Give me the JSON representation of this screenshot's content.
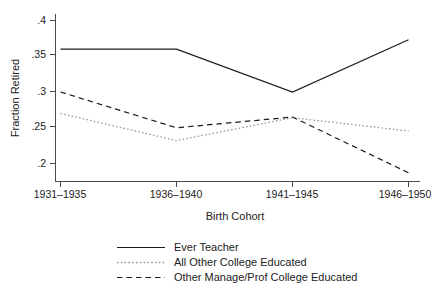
{
  "chart_data": {
    "type": "line",
    "title": "",
    "xlabel": "Birth Cohort",
    "ylabel": "Fraction Retired",
    "categories": [
      "1931–1935",
      "1936–1940",
      "1941–1945",
      "1946–1950"
    ],
    "ylim": [
      0.18,
      0.405
    ],
    "yticks": [
      0.2,
      0.25,
      0.3,
      0.35,
      0.4
    ],
    "ytick_labels": [
      ".2",
      ".25",
      ".3",
      ".35",
      ".4"
    ],
    "grid": false,
    "legend_position": "bottom",
    "series": [
      {
        "name": "Ever Teacher",
        "style": "solid",
        "color": "#1c1c1c",
        "values": [
          0.36,
          0.36,
          0.3,
          0.373
        ]
      },
      {
        "name": "All Other College Educated",
        "style": "dotted",
        "color": "#9a9a9a",
        "values": [
          0.27,
          0.232,
          0.264,
          0.2455
        ]
      },
      {
        "name": "Other Manage/Prof College Educated",
        "style": "dashed",
        "color": "#1c1c1c",
        "values": [
          0.3,
          0.25,
          0.265,
          0.187
        ]
      }
    ]
  },
  "axes": {
    "y_title": "Fraction Retired",
    "x_title": "Birth Cohort",
    "y_tick_labels": [
      ".4",
      ".35",
      ".3",
      ".25",
      ".2"
    ],
    "x_tick_labels": [
      "1931–1935",
      "1936–1940",
      "1941–1945",
      "1946–1950"
    ]
  },
  "legend": {
    "entries": [
      {
        "label": "Ever Teacher",
        "sample": "solid-line-sample"
      },
      {
        "label": "All Other College Educated",
        "sample": "dotted-line-sample"
      },
      {
        "label": "Other Manage/Prof College Educated",
        "sample": "dashed-line-sample"
      }
    ]
  }
}
